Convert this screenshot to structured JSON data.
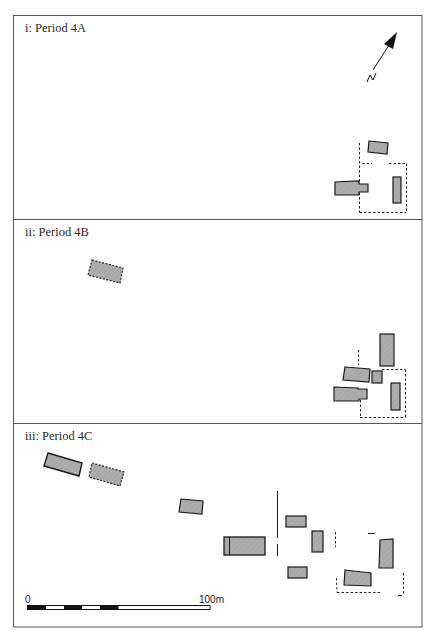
{
  "figure": {
    "panels": [
      {
        "id": "i",
        "label": "i: Period 4A"
      },
      {
        "id": "ii",
        "label": "ii: Period 4B"
      },
      {
        "id": "iii",
        "label": "iii: Period 4C"
      }
    ],
    "north_arrow": {
      "label": "N"
    },
    "scale_bar": {
      "start_label": "0",
      "end_label": "100m"
    },
    "colors": {
      "frame": "#555555",
      "building_fill": "#a9a9a9",
      "outline": "#1a1a1a",
      "background": "#ffffff"
    }
  }
}
